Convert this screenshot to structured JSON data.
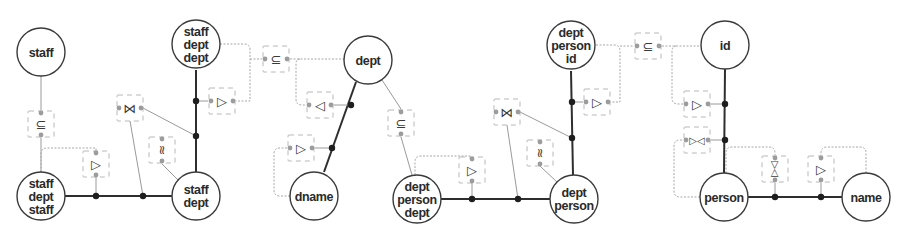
{
  "diagram": {
    "type": "conceptual-schema-graph",
    "nodes": [
      {
        "id": "n1",
        "lines": [
          "staff"
        ],
        "x": 41,
        "y": 52
      },
      {
        "id": "n2",
        "lines": [
          "staff",
          "dept",
          "staff"
        ],
        "x": 41,
        "y": 196
      },
      {
        "id": "n3",
        "lines": [
          "staff",
          "dept",
          "dept"
        ],
        "x": 196,
        "y": 44
      },
      {
        "id": "n4",
        "lines": [
          "staff",
          "dept"
        ],
        "x": 196,
        "y": 196
      },
      {
        "id": "n5",
        "lines": [
          "dept"
        ],
        "x": 368,
        "y": 60
      },
      {
        "id": "n6",
        "lines": [
          "dname"
        ],
        "x": 314,
        "y": 196
      },
      {
        "id": "n7",
        "lines": [
          "dept",
          "person",
          "dept"
        ],
        "x": 417,
        "y": 199
      },
      {
        "id": "n8",
        "lines": [
          "dept",
          "person",
          "id"
        ],
        "x": 571,
        "y": 45
      },
      {
        "id": "n9",
        "lines": [
          "dept",
          "person"
        ],
        "x": 574,
        "y": 199
      },
      {
        "id": "n10",
        "lines": [
          "id"
        ],
        "x": 725,
        "y": 45
      },
      {
        "id": "n11",
        "lines": [
          "person"
        ],
        "x": 724,
        "y": 197
      },
      {
        "id": "n12",
        "lines": [
          "name"
        ],
        "x": 866,
        "y": 197
      }
    ],
    "constraints": [
      {
        "id": "c1",
        "symbol": "⊆",
        "meaning": "subset",
        "x": 41,
        "y": 124,
        "orient": "v"
      },
      {
        "id": "c2",
        "symbol": "▷",
        "meaning": "projection-right",
        "x": 96,
        "y": 164,
        "orient": "v"
      },
      {
        "id": "c3",
        "symbol": "⋈",
        "meaning": "join",
        "x": 130,
        "y": 108,
        "orient": "h"
      },
      {
        "id": "c4",
        "symbol": "≈",
        "meaning": "equality",
        "x": 162,
        "y": 150,
        "orient": "v"
      },
      {
        "id": "c5",
        "symbol": "▷",
        "meaning": "projection-right",
        "x": 222,
        "y": 101,
        "orient": "h"
      },
      {
        "id": "c6",
        "symbol": "⊆",
        "meaning": "subset",
        "x": 276,
        "y": 59,
        "orient": "h"
      },
      {
        "id": "c7",
        "symbol": "◁",
        "meaning": "projection-left",
        "x": 320,
        "y": 105,
        "orient": "h"
      },
      {
        "id": "c8",
        "symbol": "▷",
        "meaning": "projection-right",
        "x": 301,
        "y": 148,
        "orient": "h"
      },
      {
        "id": "c9",
        "symbol": "⊆",
        "meaning": "subset",
        "x": 401,
        "y": 123,
        "orient": "v"
      },
      {
        "id": "c10",
        "symbol": "▷",
        "meaning": "projection-right",
        "x": 472,
        "y": 170,
        "orient": "v"
      },
      {
        "id": "c11",
        "symbol": "⋈",
        "meaning": "join",
        "x": 507,
        "y": 112,
        "orient": "h"
      },
      {
        "id": "c12",
        "symbol": "≈",
        "meaning": "equality",
        "x": 540,
        "y": 153,
        "orient": "v"
      },
      {
        "id": "c13",
        "symbol": "▷",
        "meaning": "projection-right",
        "x": 597,
        "y": 102,
        "orient": "h"
      },
      {
        "id": "c14",
        "symbol": "⊆",
        "meaning": "subset",
        "x": 648,
        "y": 46,
        "orient": "h"
      },
      {
        "id": "c15",
        "symbol": "▷",
        "meaning": "projection-right",
        "x": 697,
        "y": 104,
        "orient": "h"
      },
      {
        "id": "c16",
        "symbol": "▷◁",
        "meaning": "bi-projection",
        "x": 697,
        "y": 140,
        "orient": "h"
      },
      {
        "id": "c17",
        "symbol": "▷◁",
        "meaning": "bi-projection",
        "x": 775,
        "y": 169,
        "orient": "v"
      },
      {
        "id": "c18",
        "symbol": "▷",
        "meaning": "projection-right",
        "x": 821,
        "y": 169,
        "orient": "v"
      }
    ],
    "solid_edges": [
      {
        "from": "n2",
        "to": "n4"
      },
      {
        "from": "n3",
        "to": "n4"
      },
      {
        "from": "n5",
        "to": "n6"
      },
      {
        "from": "n7",
        "to": "n9"
      },
      {
        "from": "n8",
        "to": "n9"
      },
      {
        "from": "n10",
        "to": "n11"
      },
      {
        "from": "n11",
        "to": "n12"
      }
    ],
    "colors": {
      "node_stroke": "#3a3a3a",
      "solid_edge": "#2e2e2e",
      "dashed_edge": "#a8a8a8",
      "junction": "#1e1e1e",
      "port": "#9c9c9c"
    }
  }
}
